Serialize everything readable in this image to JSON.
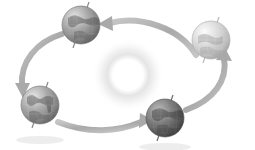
{
  "figure": {
    "width": 255,
    "height": 150,
    "background_color": "#ffffff",
    "orbit_direction": "counter-clockwise",
    "style": "grayscale"
  },
  "sun": {
    "name": "Sun",
    "center_x": 128,
    "center_y": 75,
    "outer_radius": 36,
    "inner_radius": 19,
    "glow_color": "#d8d8d8",
    "core_color": "#ffffff"
  },
  "orbit_path": {
    "name": "orbital ellipse",
    "center_x": 128,
    "center_y": 72,
    "radius_x": 92,
    "radius_y": 50,
    "stroke_color": "#b0b0b0",
    "stroke_width": 6
  },
  "globes": [
    {
      "id": "globe-top",
      "label": "Earth top position",
      "center_x": 81,
      "center_y": 25,
      "radius": 19,
      "axis_tilt_deg": 23,
      "shade": "#9a9a9a",
      "highlight": "#d6d6d6"
    },
    {
      "id": "globe-right",
      "label": "Earth right position",
      "center_x": 211,
      "center_y": 40,
      "radius": 19,
      "axis_tilt_deg": 23,
      "shade": "#c9c9c9",
      "highlight": "#f0f0f0"
    },
    {
      "id": "globe-bottom",
      "label": "Earth bottom position",
      "center_x": 165,
      "center_y": 118,
      "radius": 19,
      "axis_tilt_deg": 23,
      "shade": "#6f6f6f",
      "highlight": "#b4b4b4"
    },
    {
      "id": "globe-left",
      "label": "Earth left position",
      "center_x": 40,
      "center_y": 105,
      "radius": 19,
      "axis_tilt_deg": 23,
      "shade": "#9e9e9e",
      "highlight": "#dcdcdc"
    }
  ],
  "arrows": [
    {
      "id": "arrow-top",
      "label": "motion arrow pointing left toward top Earth",
      "direction": "left",
      "color": "#b2b2b2"
    },
    {
      "id": "arrow-left",
      "label": "motion arrow curving down toward left Earth",
      "direction": "down-left",
      "color": "#b2b2b2"
    },
    {
      "id": "arrow-bottom",
      "label": "motion arrow pointing right toward bottom Earth",
      "direction": "right",
      "color": "#b2b2b2"
    },
    {
      "id": "arrow-right",
      "label": "motion arrow curving down from right Earth",
      "direction": "down-right",
      "color": "#b2b2b2"
    }
  ],
  "shadows": [
    {
      "id": "shadow-left",
      "center_x": 40,
      "center_y": 140,
      "radius_x": 24,
      "radius_y": 4,
      "color": "#e4e4e4"
    },
    {
      "id": "shadow-bottom",
      "center_x": 165,
      "center_y": 147,
      "radius_x": 26,
      "radius_y": 4,
      "color": "#e4e4e4"
    }
  ]
}
